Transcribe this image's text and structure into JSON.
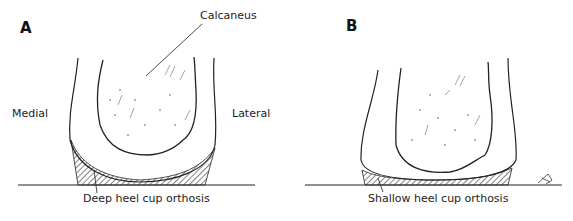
{
  "figure": {
    "panels": [
      {
        "letter": "A",
        "labels": {
          "bone": "Calcaneus",
          "medial": "Medial",
          "lateral": "Lateral",
          "orthosis": "Deep heel cup orthosis"
        }
      },
      {
        "letter": "B",
        "labels": {
          "orthosis": "Shallow heel cup orthosis"
        }
      }
    ],
    "colors": {
      "line": "#222222",
      "background": "#ffffff",
      "hatch": "#555555"
    }
  }
}
